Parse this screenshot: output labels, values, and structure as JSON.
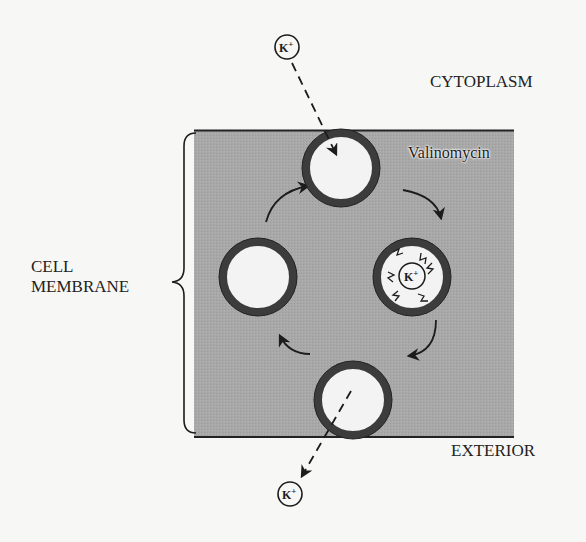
{
  "diagram": {
    "regions": {
      "cytoplasm": "CYTOPLASM",
      "exterior": "EXTERIOR",
      "membrane_line1": "CELL",
      "membrane_line2": "MEMBRANE"
    },
    "carrier_label": "Valinomycin",
    "ion": {
      "symbol": "K",
      "charge": "+"
    },
    "colors": {
      "background": "#f7f7f6",
      "membrane_fill": "#a9a9a9",
      "ring": "#3a3a3a",
      "ring_inner": "#f2f2f2",
      "line": "#222222"
    },
    "cycle_states": [
      {
        "position": "top",
        "content": "empty carrier receiving K+ from cytoplasm"
      },
      {
        "position": "right",
        "content": "carrier with K+ bound"
      },
      {
        "position": "bottom",
        "content": "carrier releasing K+ to exterior"
      },
      {
        "position": "left",
        "content": "empty carrier returning"
      }
    ]
  }
}
